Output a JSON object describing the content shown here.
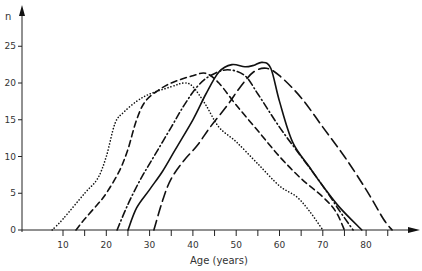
{
  "chart_data": {
    "type": "line",
    "title": "",
    "xlabel": "Age (years)",
    "ylabel": "n",
    "xlim": [
      0,
      90
    ],
    "ylim": [
      0,
      28
    ],
    "grid": false,
    "legend": null,
    "x_ticks": [
      10,
      20,
      30,
      40,
      50,
      60,
      70,
      80
    ],
    "x_minor_ticks": [
      15,
      25,
      35,
      45,
      55,
      65,
      75,
      85
    ],
    "y_ticks": [
      0,
      5,
      10,
      15,
      20,
      25
    ],
    "series": [
      {
        "name": "dotted",
        "style": "dotted",
        "points": [
          [
            7.5,
            0
          ],
          [
            10,
            1.5
          ],
          [
            15,
            5
          ],
          [
            18,
            7
          ],
          [
            20,
            10
          ],
          [
            22,
            14.5
          ],
          [
            24,
            16
          ],
          [
            27,
            17.5
          ],
          [
            30,
            18.5
          ],
          [
            35,
            19.5
          ],
          [
            38,
            20
          ],
          [
            40,
            19.5
          ],
          [
            43,
            17
          ],
          [
            46,
            14
          ],
          [
            50,
            12
          ],
          [
            55,
            9
          ],
          [
            60,
            6
          ],
          [
            64,
            4.5
          ],
          [
            67,
            2.5
          ],
          [
            70,
            0
          ]
        ]
      },
      {
        "name": "short-dash",
        "style": "dashed",
        "points": [
          [
            13,
            0
          ],
          [
            15,
            1.5
          ],
          [
            18,
            3.5
          ],
          [
            20,
            5
          ],
          [
            23,
            8
          ],
          [
            25,
            11
          ],
          [
            27,
            15
          ],
          [
            29,
            17.5
          ],
          [
            32,
            19
          ],
          [
            35,
            20
          ],
          [
            40,
            21
          ],
          [
            43,
            21.3
          ],
          [
            46,
            20
          ],
          [
            50,
            17
          ],
          [
            55,
            13.5
          ],
          [
            60,
            10
          ],
          [
            65,
            7
          ],
          [
            70,
            4.5
          ],
          [
            73,
            2.5
          ],
          [
            75,
            0
          ]
        ]
      },
      {
        "name": "dash-dot",
        "style": "dashdot",
        "points": [
          [
            22.5,
            0
          ],
          [
            25,
            3.5
          ],
          [
            28,
            7
          ],
          [
            31,
            10
          ],
          [
            35,
            14
          ],
          [
            38,
            17
          ],
          [
            41,
            19.5
          ],
          [
            44,
            21
          ],
          [
            48,
            21.8
          ],
          [
            52,
            21
          ],
          [
            55,
            18.5
          ],
          [
            60,
            14
          ],
          [
            65,
            10
          ],
          [
            70,
            6
          ],
          [
            74,
            2.5
          ],
          [
            77,
            0
          ]
        ]
      },
      {
        "name": "solid",
        "style": "solid",
        "points": [
          [
            25,
            0
          ],
          [
            27,
            3
          ],
          [
            30,
            5.5
          ],
          [
            33,
            8
          ],
          [
            36,
            11
          ],
          [
            40,
            15
          ],
          [
            43,
            18.5
          ],
          [
            46,
            21.5
          ],
          [
            49,
            22.5
          ],
          [
            52,
            22.2
          ],
          [
            54,
            22.4
          ],
          [
            56,
            22.8
          ],
          [
            58,
            22
          ],
          [
            60,
            17.5
          ],
          [
            63,
            12
          ],
          [
            67,
            8.5
          ],
          [
            70,
            6
          ],
          [
            74,
            3
          ],
          [
            79,
            0
          ]
        ]
      },
      {
        "name": "long-dash",
        "style": "longdash",
        "points": [
          [
            31,
            0
          ],
          [
            33,
            4
          ],
          [
            35,
            7
          ],
          [
            38,
            9.5
          ],
          [
            41,
            11.5
          ],
          [
            44,
            14
          ],
          [
            48,
            17
          ],
          [
            51,
            19.5
          ],
          [
            54,
            21.5
          ],
          [
            57,
            22
          ],
          [
            60,
            21
          ],
          [
            65,
            18
          ],
          [
            70,
            14
          ],
          [
            75,
            10
          ],
          [
            80,
            5.5
          ],
          [
            84,
            1.5
          ],
          [
            86,
            0
          ]
        ]
      }
    ]
  },
  "axes": {
    "y_label": "n",
    "x_label": "Age (years)",
    "x_tick_labels": [
      "10",
      "20",
      "30",
      "40",
      "50",
      "60",
      "70",
      "80"
    ],
    "y_tick_labels": [
      "0",
      "5",
      "10",
      "15",
      "20",
      "25"
    ]
  }
}
